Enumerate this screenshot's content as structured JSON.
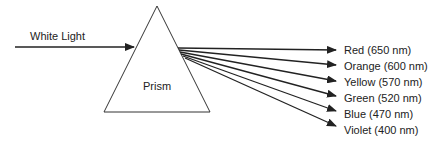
{
  "diagram": {
    "input_label": "White Light",
    "prism_label": "Prism",
    "colors": {
      "stroke": "#222222",
      "text": "#222222",
      "background": "#ffffff"
    },
    "rays": [
      {
        "label": "Red (650 nm)",
        "color_name": "Red",
        "wavelength_nm": 650
      },
      {
        "label": "Orange (600 nm)",
        "color_name": "Orange",
        "wavelength_nm": 600
      },
      {
        "label": "Yellow (570 nm)",
        "color_name": "Yellow",
        "wavelength_nm": 570
      },
      {
        "label": "Green (520 nm)",
        "color_name": "Green",
        "wavelength_nm": 520
      },
      {
        "label": "Blue (470 nm)",
        "color_name": "Blue",
        "wavelength_nm": 470
      },
      {
        "label": "Violet (400 nm)",
        "color_name": "Violet",
        "wavelength_nm": 400
      }
    ]
  }
}
